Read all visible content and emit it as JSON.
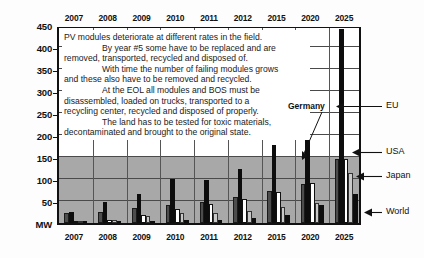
{
  "chart_data": {
    "type": "bar",
    "title": "",
    "xlabel": "",
    "ylabel": "MW",
    "ylim": [
      0,
      450
    ],
    "yticks": [
      0,
      50,
      100,
      150,
      200,
      250,
      300,
      350,
      400,
      450
    ],
    "ytick_labels": [
      "MW",
      "50",
      "100",
      "150",
      "200",
      "250",
      "300",
      "350",
      "400",
      "450"
    ],
    "grid": true,
    "legend_position": "right-annotations",
    "categories": [
      "2007",
      "2008",
      "2009",
      "2010",
      "2011",
      "2012",
      "2015",
      "2020",
      "2025"
    ],
    "series": [
      {
        "name": "Germany",
        "color": "#4d4d4d",
        "values": [
          22,
          25,
          33,
          42,
          48,
          60,
          72,
          88,
          145
        ]
      },
      {
        "name": "EU",
        "color": "#0d0d0d",
        "values": [
          25,
          47,
          65,
          100,
          97,
          122,
          178,
          230,
          440
        ]
      },
      {
        "name": "USA",
        "color": "#ffffff",
        "values": [
          4,
          6,
          18,
          31,
          43,
          55,
          70,
          90,
          145
        ]
      },
      {
        "name": "Japan",
        "color": "#c9c9c9",
        "values": [
          3,
          7,
          16,
          22,
          23,
          27,
          36,
          45,
          113
        ]
      },
      {
        "name": "World",
        "color": "#0d0d0d",
        "values": [
          5,
          5,
          5,
          6,
          7,
          12,
          18,
          40,
          65
        ]
      }
    ],
    "annotations": [
      {
        "text": "Germany",
        "target": "2020 Germany bar"
      },
      {
        "text": "EU",
        "target": "2025 EU bar"
      },
      {
        "text": "USA",
        "target": "2025 USA bar"
      },
      {
        "text": "Japan",
        "target": "2025 Japan bar"
      },
      {
        "text": "World",
        "target": "2025 World bar"
      }
    ],
    "note_lines": [
      {
        "text": "PV modules deteriorate at different rates in the field.",
        "indent": false
      },
      {
        "text": "By year #5 some have to be replaced and are",
        "indent": true
      },
      {
        "text": "removed, transported, recycled and disposed of.",
        "indent": false
      },
      {
        "text": "With time the number of failing modules grows",
        "indent": true
      },
      {
        "text": "and these also have to be removed and recycled.",
        "indent": false
      },
      {
        "text": "At the EOL all modules and BOS must be",
        "indent": true
      },
      {
        "text": "disassembled, loaded on trucks, transported to a",
        "indent": false
      },
      {
        "text": "recycling center, recycled and disposed of properly.",
        "indent": false
      },
      {
        "text": "The land has to be tested for toxic materials,",
        "indent": true
      },
      {
        "text": "decontaminated and brought to the original state.",
        "indent": false
      }
    ]
  },
  "axis": {
    "top_years": [
      "2007",
      "2008",
      "2009",
      "2010",
      "2011",
      "2012",
      "2015",
      "2020",
      "2025"
    ],
    "bottom_years": [
      "2007",
      "2008",
      "2009",
      "2010",
      "2011",
      "2012",
      "2015",
      "2020",
      "2025"
    ],
    "y_labels": [
      "450",
      "400",
      "350",
      "300",
      "250",
      "200",
      "150",
      "100",
      "50",
      "MW"
    ]
  },
  "callouts": {
    "germany": "Germany",
    "eu": "EU",
    "usa": "USA",
    "japan": "Japan",
    "world": "World"
  }
}
